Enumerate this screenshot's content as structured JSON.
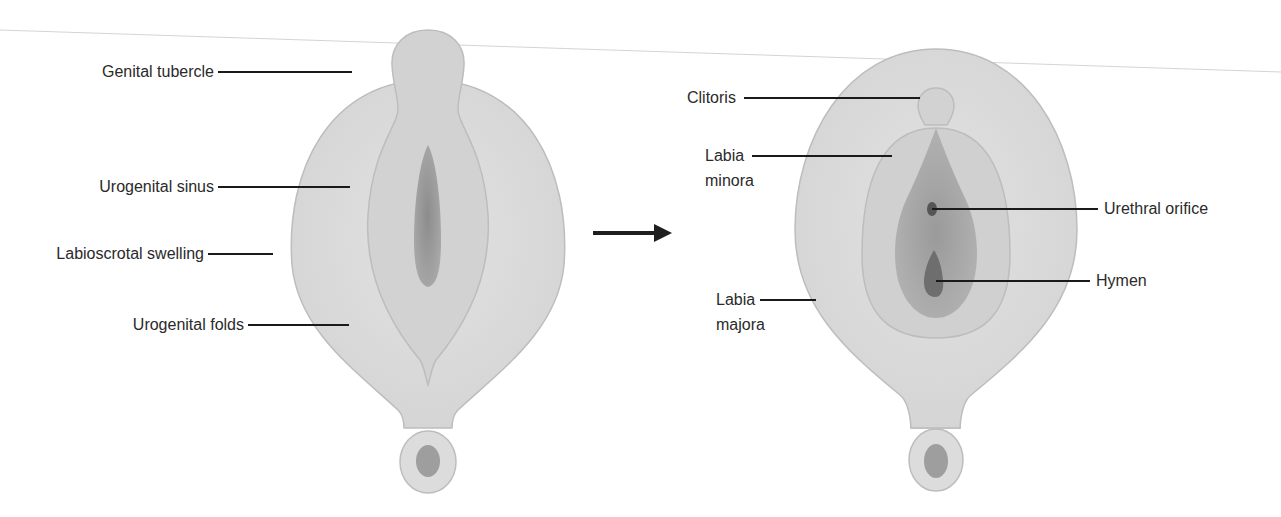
{
  "figure": {
    "left_panel": {
      "name": "indifferent-stage",
      "labels": [
        {
          "id": "genital-tubercle",
          "text": "Genital tubercle"
        },
        {
          "id": "urogenital-sinus",
          "text": "Urogenital sinus"
        },
        {
          "id": "labioscrotal-swelling",
          "text": "Labioscrotal swelling"
        },
        {
          "id": "urogenital-folds",
          "text": "Urogenital folds"
        }
      ]
    },
    "arrow": {
      "icon": "right-arrow-icon"
    },
    "right_panel": {
      "name": "female-differentiation",
      "labels": [
        {
          "id": "clitoris",
          "text": "Clitoris"
        },
        {
          "id": "labia-minora",
          "line1": "Labia",
          "line2": "minora"
        },
        {
          "id": "urethral-orifice",
          "text": "Urethral orifice"
        },
        {
          "id": "hymen",
          "text": "Hymen"
        },
        {
          "id": "labia-majora",
          "line1": "Labia",
          "line2": "majora"
        }
      ]
    },
    "colors": {
      "background": "#ffffff",
      "outer_fill": "#dcdcdc",
      "outer_stroke": "#bdbdbd",
      "mid_fill": "#d0d0d0",
      "inner_fill": "#a9a9a9",
      "dark_fill": "#6e6e6e",
      "leader_line": "#1a1a1a",
      "text": "#2a2a2a"
    }
  }
}
